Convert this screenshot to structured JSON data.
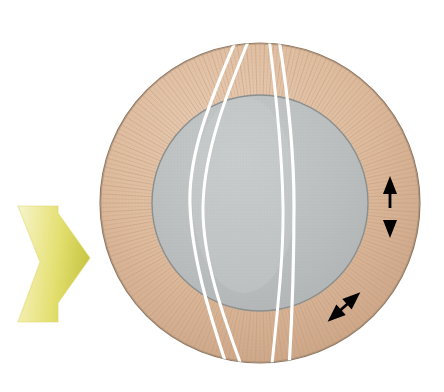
{
  "figure": {
    "title": "Circular cross-section with annulus, inner disc, fracture traces and displacement arrows",
    "background_color": "#ffffff",
    "canvas": {
      "width": 444,
      "height": 392
    }
  },
  "colors": {
    "annulus_fill": "#dcb99a",
    "annulus_fill_light": "#e8cdb4",
    "annulus_fill_dark": "#c9a183",
    "annulus_stroke": "#8e7a66",
    "annulus_striation": "#c19a7b",
    "inner_disc_fill": "#b9bdbd",
    "inner_disc_fill_light": "#c6caca",
    "inner_disc_grid": "#a9adad",
    "inner_disc_stroke": "#8a8f8f",
    "fracture_line": "#ffffff",
    "arrow_black": "#000000",
    "load_arrow_light": "#f2f0b0",
    "load_arrow_mid": "#e6e27a",
    "load_arrow_dark": "#c9c84a"
  },
  "shapes": {
    "outer_circle": {
      "cx": 260,
      "cy": 203,
      "r": 160,
      "label": "outer-annulus-circle"
    },
    "inner_circle": {
      "cx": 260,
      "cy": 203,
      "r": 108,
      "label": "inner-disc-circle"
    },
    "annulus_width": 52,
    "striation_count": 220
  },
  "fracture_lines": [
    {
      "id": "fracture-1",
      "label": "fracture-trace-1",
      "x_top": 238,
      "x_mid": 190,
      "x_bottom": 232
    },
    {
      "id": "fracture-2",
      "label": "fracture-trace-2",
      "x_top": 252,
      "x_mid": 203,
      "x_bottom": 248
    },
    {
      "id": "fracture-3",
      "label": "fracture-trace-3",
      "x_top": 268,
      "x_mid": 283,
      "x_bottom": 270
    },
    {
      "id": "fracture-4",
      "label": "fracture-trace-4",
      "x_top": 278,
      "x_mid": 294,
      "x_bottom": 288
    }
  ],
  "annotations": {
    "vertical_arrow": {
      "name": "vertical-double-arrow",
      "description": "double-headed arrow oriented vertically within the annulus at the right side",
      "x": 390,
      "y_top": 178,
      "y_bottom": 237,
      "orientation": "vertical",
      "heads": "both"
    },
    "radial_arrow": {
      "name": "radial-double-arrow",
      "description": "double-headed arrow oriented radially (up-right / down-left) in the lower-right annulus",
      "x1": 326,
      "y1": 322,
      "x2": 362,
      "y2": 292,
      "orientation": "diagonal-45",
      "heads": "both"
    },
    "load_arrow": {
      "name": "load-direction-arrow",
      "description": "large yellow gradient block arrow pointing right, indicating applied load direction",
      "tip_x": 90,
      "tip_y": 258,
      "tail_x": 18,
      "span_y": [
        206,
        322
      ],
      "direction": "right"
    }
  }
}
